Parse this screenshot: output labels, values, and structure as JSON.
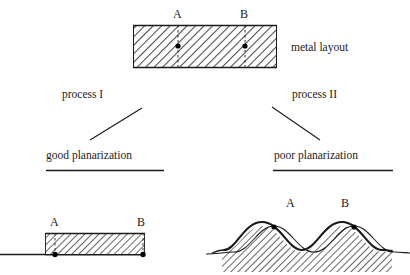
{
  "figure": {
    "background_color": "#ffffff",
    "line_color": "#1a1a1a",
    "hatch_color": "#555555"
  },
  "top_structure": {
    "name": "metal layout slab",
    "caption": "metal layout",
    "point_a_label": "A",
    "point_b_label": "B",
    "rect": {
      "x": 133,
      "y": 25,
      "width": 144,
      "height": 43
    },
    "point_a_x": 178,
    "point_b_x": 245,
    "point_y": 46
  },
  "branches": {
    "left": {
      "process_label": "process I",
      "outcome_label": "good planarization"
    },
    "right": {
      "process_label": "process II",
      "outcome_label": "poor planarization"
    }
  },
  "bottom_left_structure": {
    "name": "flat planarized slab",
    "point_a_label": "A",
    "point_b_label": "B",
    "slab": {
      "x": 45,
      "y": 233,
      "width": 100,
      "height": 22
    },
    "point_a_x": 55,
    "point_b_x": 143,
    "baseline_y": 255
  },
  "bottom_right_structure": {
    "name": "wavy non-planarized band",
    "point_a_label": "A",
    "point_b_label": "B",
    "point_a_x": 288,
    "point_b_x": 343,
    "point_y": 243,
    "wave_start_x": 222,
    "wave_end_x": 392,
    "crest_y": 225,
    "trough_y": 258
  },
  "labels": {
    "point_a": "A",
    "point_b": "B"
  }
}
